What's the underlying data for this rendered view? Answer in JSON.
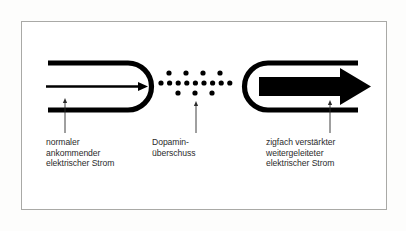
{
  "figure": {
    "background_color": "#fdfdfc",
    "panel_color": "#ffffff",
    "frame_color": "#a9a9a6",
    "ink_color": "#000000",
    "text_color": "#2b2b2b"
  },
  "captions": {
    "input": "normaler\nankommender\nelektrischer Strom",
    "dopamine": "Dopamin-\nüberschuss",
    "output": "zigfach verstärkter\nweitergeleiteter\nelektrischer Strom"
  },
  "elements": {
    "left_terminal_name": "incoming-neuron-terminal",
    "left_arrow_name": "thin-current-arrow",
    "dopamine_cluster_name": "dopamine-dot-cluster",
    "right_terminal_name": "receiving-neuron-terminal",
    "right_arrow_name": "thick-current-arrow"
  },
  "dopamine_dots": {
    "rows": [
      {
        "count": 4,
        "y": 73,
        "x_start": 169,
        "spacing": 17
      },
      {
        "count": 9,
        "y": 83,
        "x_start": 161,
        "spacing": 8.6
      },
      {
        "count": 3,
        "y": 93,
        "x_start": 178,
        "spacing": 17
      }
    ],
    "radius": 2.6
  },
  "pointers": [
    {
      "name": "pointer-input",
      "x": 65,
      "y_top": 98,
      "y_bottom": 133
    },
    {
      "name": "pointer-dopamine",
      "x": 196,
      "y_top": 101,
      "y_bottom": 133
    },
    {
      "name": "pointer-output",
      "x": 330,
      "y_top": 100,
      "y_bottom": 133
    }
  ]
}
